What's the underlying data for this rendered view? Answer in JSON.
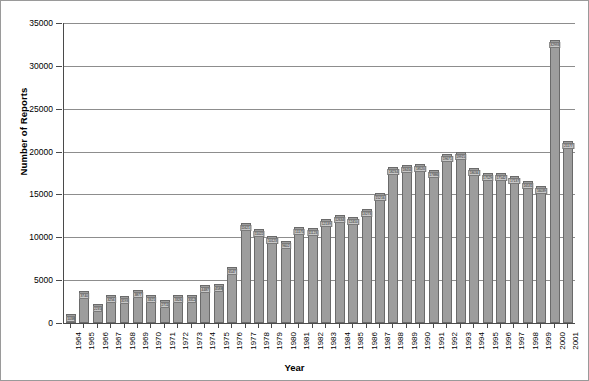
{
  "chart_data": {
    "type": "bar",
    "title": "",
    "xlabel": "Year",
    "ylabel": "Number of Reports",
    "ylim": [
      0,
      35000
    ],
    "ytick_step": 5000,
    "grid": true,
    "legend": null,
    "bar_color": "#9d9d9d",
    "bar_border_color": "#6a6a6a",
    "categories": [
      "1964",
      "1965",
      "1966",
      "1967",
      "1968",
      "1969",
      "1970",
      "1971",
      "1972",
      "1973",
      "1974",
      "1975",
      "1976",
      "1977",
      "1978",
      "1979",
      "1980",
      "1981",
      "1982",
      "1983",
      "1984",
      "1985",
      "1986",
      "1987",
      "1988",
      "1989",
      "1990",
      "1991",
      "1992",
      "1993",
      "1994",
      "1995",
      "1996",
      "1997",
      "1998",
      "1999",
      "2000",
      "2001"
    ],
    "values": [
      1038,
      3740,
      2235,
      3256,
      3193,
      3877,
      3321,
      2711,
      3326,
      3312,
      4487,
      4588,
      6547,
      11621,
      11022,
      10123,
      9602,
      11175,
      11123,
      12139,
      12634,
      12410,
      13273,
      15216,
      18234,
      18434,
      18520,
      17886,
      19671,
      19915,
      18034,
      17529,
      17542,
      17137,
      16531,
      16039,
      18401,
      18403
    ],
    "yticks": [
      "0",
      "5000",
      "10000",
      "15000",
      "20000",
      "25000",
      "30000",
      "35000"
    ],
    "ytick_values": [
      0,
      5000,
      10000,
      15000,
      20000,
      25000,
      30000,
      35000
    ],
    "bar_labels": [
      "1038",
      "3740",
      "2235",
      "3256",
      "3193",
      "3877",
      "3321",
      "2711",
      "3326",
      "3312",
      "4487",
      "4588",
      "6547",
      "11621",
      "11022",
      "10123",
      "9602",
      "11175",
      "11123",
      "12139",
      "12634",
      "12410",
      "13273",
      "15216",
      "18234",
      "18434",
      "18520",
      "17886",
      "19671",
      "19915",
      "18034",
      "17529",
      "17542",
      "17137",
      "16531",
      "16039",
      "18403",
      "18401"
    ],
    "note_tall_bars": {
      "2000": 32993,
      "2001": 21177
    }
  },
  "axes": {
    "y_title": "Number of Reports",
    "x_title": "Year"
  }
}
